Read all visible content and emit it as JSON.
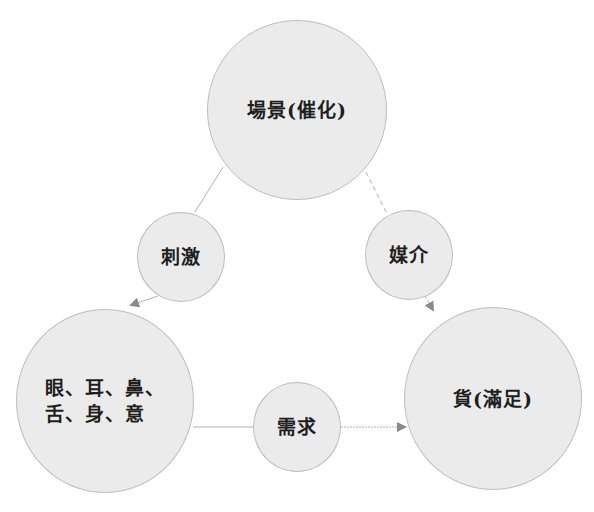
{
  "diagram": {
    "type": "cycle",
    "nodes": {
      "scene": {
        "label": "場景(催化)"
      },
      "stimulus": {
        "label": "刺激"
      },
      "medium": {
        "label": "媒介"
      },
      "senses": {
        "lines": [
          "眼、耳、鼻、",
          "舌、身、意"
        ]
      },
      "goods": {
        "label": "貨(滿足)"
      },
      "demand": {
        "label": "需求"
      }
    },
    "edges": [
      {
        "from": "scene",
        "via": "stimulus",
        "to": "senses",
        "style": "solid",
        "arrow": true
      },
      {
        "from": "scene",
        "via": "medium",
        "to": "goods",
        "style": "dashed",
        "arrow": true
      },
      {
        "from": "senses",
        "via": "demand",
        "to": "goods",
        "style": "solid-then-dotted",
        "arrow": true
      }
    ],
    "colors": {
      "fill": "#ebebeb",
      "stroke": "#bdbdbd",
      "line": "#a8a8a8",
      "arrow": "#8a8a8a",
      "text": "#1e1e1e"
    }
  }
}
